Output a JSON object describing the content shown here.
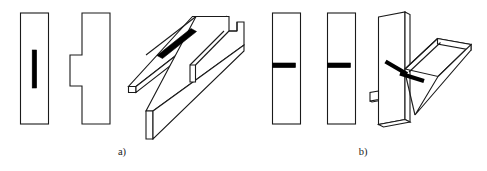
{
  "figure": {
    "background_color": "#ffffff",
    "line_color": "#1a1a1a",
    "weld_color": "#000000",
    "captions": [
      {
        "id": "caption-a",
        "label": "a)",
        "x": 122,
        "y": 155
      },
      {
        "id": "caption-b",
        "label": "b)",
        "x": 363,
        "y": 155
      }
    ],
    "panels": [
      {
        "id": "panel-a",
        "caption": "a)",
        "views": [
          {
            "id": "view-a-front",
            "name": "front-view-plate-with-slot-weld",
            "description": "plain rectangle with vertical weld bead"
          },
          {
            "id": "view-a-side",
            "name": "side-view-plate-with-lug",
            "description": "rectangle with rectangular lug protruding left"
          },
          {
            "id": "view-a-iso",
            "name": "isometric-view-lap-joint",
            "description": "two overlapping plates with notch and slot weld bead"
          }
        ]
      },
      {
        "id": "panel-b",
        "caption": "b)",
        "views": [
          {
            "id": "view-b-front",
            "name": "front-view-plate-with-fillet-weld",
            "description": "rectangle with horizontal weld bead at mid height"
          },
          {
            "id": "view-b-side",
            "name": "side-view-plate-with-fillet-weld",
            "description": "rectangle with horizontal weld bead at mid height"
          },
          {
            "id": "view-b-iso",
            "name": "isometric-view-tee-joint",
            "description": "vertical plate with angled plate welded at mid height"
          }
        ]
      }
    ]
  }
}
